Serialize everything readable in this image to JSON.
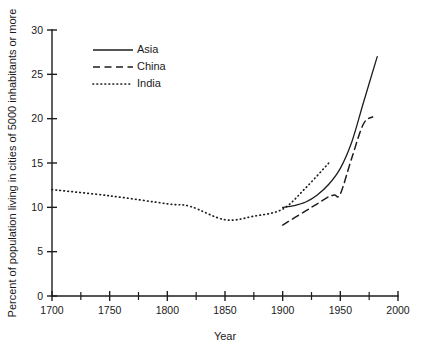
{
  "chart_data": {
    "type": "line",
    "title": "",
    "xlabel": "Year",
    "ylabel": "Percent of population living in cities of 5000 inhabitants or more",
    "xlim": [
      1700,
      2000
    ],
    "ylim": [
      0,
      30
    ],
    "x_ticks_major": [
      1700,
      1750,
      1800,
      1850,
      1900,
      1950,
      2000
    ],
    "x_ticks_minor": [
      1725,
      1775,
      1825,
      1875,
      1925,
      1975
    ],
    "y_ticks_major": [
      0,
      5,
      10,
      15,
      20,
      25,
      30
    ],
    "x_tick_labels": [
      "1700",
      "1750",
      "1800",
      "1850",
      "1900",
      "1950",
      "2000"
    ],
    "y_tick_labels": [
      "0",
      "5",
      "10",
      "15",
      "20",
      "25",
      "30"
    ],
    "grid": false,
    "legend_position": "upper-left-inside",
    "series": [
      {
        "name": "Asia",
        "style": "solid",
        "color": "#1d1d1d",
        "x": [
          1900,
          1910,
          1920,
          1930,
          1940,
          1950,
          1960,
          1970,
          1982
        ],
        "y": [
          10.0,
          10.2,
          10.6,
          11.4,
          12.6,
          14.4,
          17.4,
          21.8,
          27.0
        ]
      },
      {
        "name": "China",
        "style": "dashed",
        "color": "#1d1d1d",
        "x": [
          1900,
          1920,
          1930,
          1940,
          1945,
          1950,
          1960,
          1970,
          1978
        ],
        "y": [
          8.0,
          9.6,
          10.4,
          11.2,
          11.4,
          11.5,
          15.6,
          19.4,
          20.2
        ]
      },
      {
        "name": "India",
        "style": "dotted",
        "color": "#1d1d1d",
        "x": [
          1700,
          1750,
          1800,
          1820,
          1850,
          1875,
          1900,
          1920,
          1940
        ],
        "y": [
          12.0,
          11.3,
          10.4,
          10.1,
          8.6,
          9.0,
          9.8,
          12.2,
          15.0
        ]
      }
    ]
  },
  "legend": {
    "items": [
      {
        "label": "Asia",
        "style": "solid"
      },
      {
        "label": "China",
        "style": "dashed"
      },
      {
        "label": "India",
        "style": "dotted"
      }
    ]
  }
}
